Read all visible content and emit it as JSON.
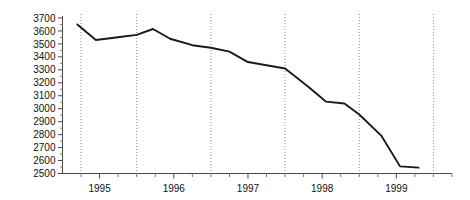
{
  "chart_data": {
    "type": "line",
    "title": "",
    "subtitle": "",
    "xlabel": "",
    "ylabel": "",
    "xlim": [
      1994.5,
      1999.75
    ],
    "ylim": [
      2500,
      3700
    ],
    "grid": "vertical-dotted-at-year-boundaries",
    "legend": "none",
    "y_ticks": [
      2500,
      2600,
      2700,
      2800,
      2900,
      3000,
      3100,
      3200,
      3300,
      3400,
      3500,
      3600,
      3700
    ],
    "y_tick_labels": [
      "2500",
      "2600",
      "2700",
      "2800",
      "2900",
      "3000",
      "3100",
      "3200",
      "3300",
      "3400",
      "3500",
      "3600",
      "3700"
    ],
    "y_minor_tick_step": 50,
    "x_ticks": [
      1995,
      1996,
      1997,
      1998,
      1999
    ],
    "x_tick_labels": [
      "1995",
      "1996",
      "1997",
      "1998",
      "1999"
    ],
    "x_minor_tick_step": 0.25,
    "gridline_x_values": [
      1994.75,
      1995.5,
      1996.5,
      1997.5,
      1998.5,
      1999.5
    ],
    "series": [
      {
        "name": "series-1",
        "color": "#1a1a1a",
        "x": [
          1994.7,
          1994.95,
          1995.3,
          1995.5,
          1995.72,
          1995.95,
          1996.25,
          1996.5,
          1996.75,
          1997.0,
          1997.25,
          1997.5,
          1997.8,
          1998.05,
          1998.3,
          1998.5,
          1998.8,
          1999.05,
          1999.3
        ],
        "y": [
          3650,
          3530,
          3555,
          3570,
          3615,
          3540,
          3490,
          3470,
          3440,
          3360,
          3335,
          3310,
          3175,
          3055,
          3040,
          2955,
          2790,
          2555,
          2545
        ]
      }
    ]
  },
  "axes": {
    "y_axis_name": "value-axis",
    "x_axis_name": "year-axis"
  }
}
